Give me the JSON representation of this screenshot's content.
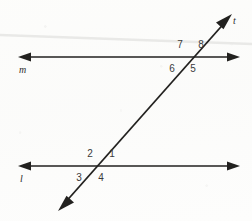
{
  "figure": {
    "background_color": "#fdfdfc",
    "ink_color": "#22211f",
    "label_color": "#3a3a3a",
    "artifact_color": "#e8e8e6"
  },
  "lines": [
    {
      "id": "line-m",
      "label": "m",
      "label_x": 19,
      "label_y": 73,
      "x1": 18,
      "y1": 57,
      "x2": 240,
      "y2": 57,
      "arrows": "both"
    },
    {
      "id": "line-l",
      "label": "l",
      "label_x": 20,
      "label_y": 182,
      "x1": 18,
      "y1": 166,
      "x2": 240,
      "y2": 166,
      "arrows": "both"
    },
    {
      "id": "line-t",
      "label": "t",
      "label_x": 232,
      "label_y": 23,
      "x1": 58,
      "y1": 211,
      "x2": 232,
      "y2": 14,
      "arrows": "both"
    }
  ],
  "intersections": [
    {
      "id": "upper-intersection",
      "on_line": "m",
      "x": 188,
      "y": 57
    },
    {
      "id": "lower-intersection",
      "on_line": "l",
      "x": 98,
      "y": 166
    }
  ],
  "angle_labels": [
    {
      "id": "angle-7",
      "text": "7",
      "x": 180,
      "y": 48,
      "intersection": "upper-intersection",
      "position": "upper-left"
    },
    {
      "id": "angle-8",
      "text": "8",
      "x": 201,
      "y": 48,
      "intersection": "upper-intersection",
      "position": "upper-right"
    },
    {
      "id": "angle-6",
      "text": "6",
      "x": 172,
      "y": 72,
      "intersection": "upper-intersection",
      "position": "lower-left"
    },
    {
      "id": "angle-5",
      "text": "5",
      "x": 193,
      "y": 72,
      "intersection": "upper-intersection",
      "position": "lower-right"
    },
    {
      "id": "angle-2",
      "text": "2",
      "x": 90,
      "y": 157,
      "intersection": "lower-intersection",
      "position": "upper-left"
    },
    {
      "id": "angle-1",
      "text": "1",
      "x": 112,
      "y": 157,
      "intersection": "lower-intersection",
      "position": "upper-right"
    },
    {
      "id": "angle-3",
      "text": "3",
      "x": 79,
      "y": 181,
      "intersection": "lower-intersection",
      "position": "lower-left"
    },
    {
      "id": "angle-4",
      "text": "4",
      "x": 101,
      "y": 181,
      "intersection": "lower-intersection",
      "position": "lower-right"
    }
  ],
  "artifacts": [
    {
      "id": "scan-streak",
      "x1": 0,
      "y1": 35,
      "x2": 252,
      "y2": 44,
      "color": "#e9e9e7"
    }
  ]
}
